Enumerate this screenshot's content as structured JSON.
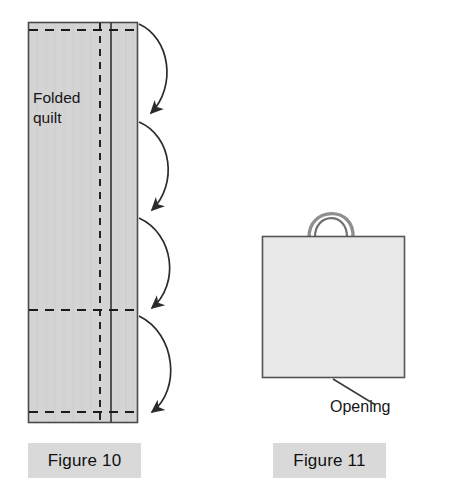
{
  "page": {
    "width": 456,
    "height": 503,
    "background": "#ffffff"
  },
  "colors": {
    "quilt_fill": "#d4d4d4",
    "bag_fill": "#e8e8e8",
    "outline": "#4a4a4a",
    "dash_line": "#1a1a1a",
    "caption_background": "#d9d9d9",
    "text": "#161616",
    "arrow": "#2b2b2b",
    "handle": "#9a9a9a"
  },
  "figure10": {
    "caption": "Figure 10",
    "annotation_label": "Folded quilt",
    "annotation_lines": [
      "Folded",
      "quilt"
    ],
    "quilt": {
      "x": 28,
      "y": 22,
      "width": 110,
      "height": 401,
      "fill": "#d4d4d4",
      "stroke": "#4a4a4a"
    },
    "solid_fold_line_x": 111,
    "dashed_vertical_line_x": 100,
    "dashed_horizontal_lines_y": [
      30,
      310,
      412
    ],
    "arrow_count": 4,
    "arrows": [
      {
        "name": "fold-arrow-1",
        "start_y": 24,
        "end_y": 118
      },
      {
        "name": "fold-arrow-2",
        "start_y": 122,
        "end_y": 214
      },
      {
        "name": "fold-arrow-3",
        "start_y": 218,
        "end_y": 312
      },
      {
        "name": "fold-arrow-4",
        "start_y": 316,
        "end_y": 416
      }
    ]
  },
  "figure11": {
    "caption": "Figure 11",
    "annotation_label": "Opening",
    "bag": {
      "x": 262,
      "y": 236,
      "width": 143,
      "height": 142,
      "fill": "#e8e8e8",
      "stroke": "#4a4a4a"
    },
    "handle": {
      "left_x": 310,
      "right_x": 352,
      "top_y": 202,
      "base_y": 237
    },
    "leader_line": {
      "from_x": 333,
      "from_y": 379,
      "to_x": 374,
      "to_y": 404
    }
  }
}
